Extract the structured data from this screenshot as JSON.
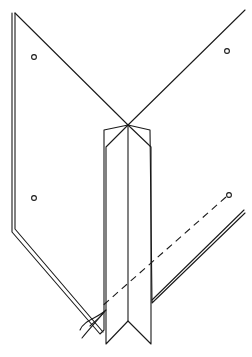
{
  "figure": {
    "title": "",
    "background": "#ffffff",
    "stroke_color": "#1a1a1a",
    "left_wing": {
      "outer": [
        [
          15,
          13
        ],
        [
          128,
          125
        ],
        [
          104,
          130
        ],
        [
          104,
          330
        ],
        [
          100,
          334
        ],
        [
          12,
          232
        ],
        [
          12,
          13
        ]
      ],
      "inner_edge": [
        [
          15,
          13
        ],
        [
          15,
          229
        ],
        [
          103,
          332
        ]
      ]
    },
    "right_wing": {
      "outer": [
        [
          245,
          10
        ],
        [
          128,
          125
        ],
        [
          150,
          130
        ],
        [
          152,
          303
        ],
        [
          245,
          213
        ]
      ],
      "inner_edge": [
        [
          152,
          300
        ],
        [
          244,
          210
        ]
      ]
    },
    "center_strip": {
      "outer": [
        [
          128,
          125
        ],
        [
          106,
          147
        ],
        [
          106,
          344
        ],
        [
          128,
          321
        ],
        [
          151,
          344
        ],
        [
          151,
          147
        ],
        [
          128,
          125
        ]
      ],
      "fold_line": [
        [
          128,
          125
        ],
        [
          128,
          321
        ]
      ]
    },
    "holes": [
      {
        "name": "top-left",
        "cx": 34,
        "cy": 57,
        "r": 2.4
      },
      {
        "name": "top-right",
        "cx": 227,
        "cy": 51,
        "r": 2.4
      },
      {
        "name": "bottom-left",
        "cx": 34,
        "cy": 198,
        "r": 2.4
      },
      {
        "name": "bottom-right",
        "cx": 229,
        "cy": 195,
        "r": 2.4
      }
    ],
    "dashed_line": {
      "x1": 226,
      "y1": 197,
      "x2": 100,
      "y2": 308
    },
    "thread": {
      "strands": [
        "M106 310 C 98 318, 84 320, 80 330",
        "M105 311 C 96 322, 90 328, 82 338",
        "M104 312 C 100 318, 94 322, 90 326"
      ]
    }
  }
}
